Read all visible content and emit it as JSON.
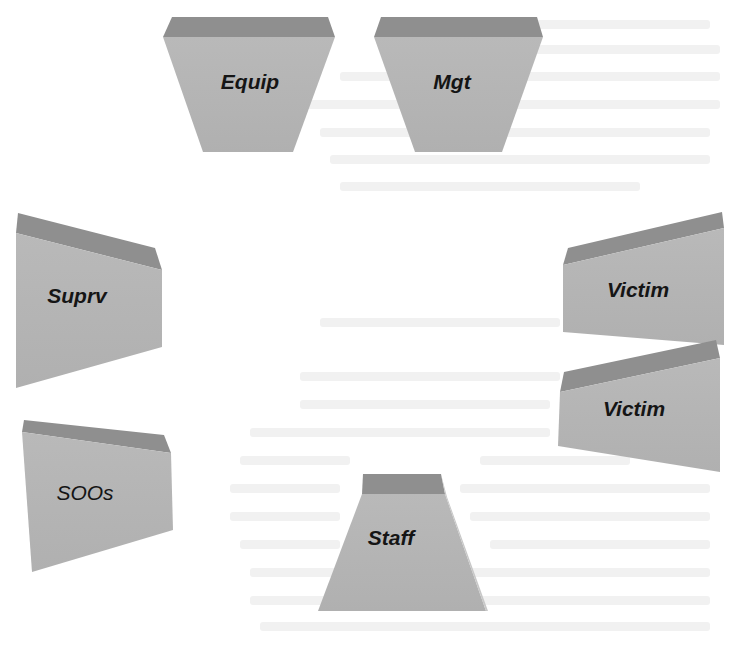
{
  "diagram": {
    "title": "",
    "colors": {
      "front_face": "#b5b5b5",
      "top_face": "#8f8f8f",
      "side_face": "#c8c8c8",
      "label": "#151515",
      "background": "#ffffff"
    },
    "blocks": [
      {
        "id": "equip",
        "label": "Equip"
      },
      {
        "id": "mgt",
        "label": "Mgt"
      },
      {
        "id": "suprv",
        "label": "Suprv"
      },
      {
        "id": "victim1",
        "label": "Victim"
      },
      {
        "id": "victim2",
        "label": "Victim"
      },
      {
        "id": "soos",
        "label": "SOOs"
      },
      {
        "id": "staff",
        "label": "Staff"
      }
    ]
  }
}
